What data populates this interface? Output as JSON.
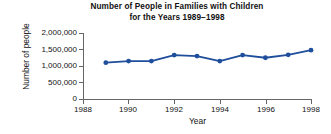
{
  "chart_data": {
    "type": "line",
    "title": "Number of People in Families with Children for the Years 1989−1998",
    "title_lines": [
      "Number of People in Families with Children",
      "for the Years 1989−1998"
    ],
    "xlabel": "Year",
    "ylabel": "Number of people",
    "x": [
      1989,
      1990,
      1991,
      1992,
      1993,
      1994,
      1995,
      1996,
      1997,
      1998
    ],
    "values": [
      1100000,
      1150000,
      1150000,
      1330000,
      1300000,
      1150000,
      1330000,
      1250000,
      1340000,
      1480000
    ],
    "series": [
      {
        "name": "Number of people",
        "values": [
          1100000,
          1150000,
          1150000,
          1330000,
          1300000,
          1150000,
          1330000,
          1250000,
          1340000,
          1480000
        ]
      }
    ],
    "xlim": [
      1988,
      1998
    ],
    "ylim": [
      0,
      2000000
    ],
    "xticks": [
      1988,
      1990,
      1992,
      1994,
      1996,
      1998
    ],
    "xtick_labels": [
      "1988",
      "1990",
      "1992",
      "1994",
      "1996",
      "1998"
    ],
    "yticks": [
      0,
      500000,
      1000000,
      1500000,
      2000000
    ],
    "ytick_labels": [
      "0",
      "500,000",
      "1,000,000",
      "1,500,000",
      "2,000,000"
    ],
    "grid": false,
    "legend": null,
    "marker": "circle",
    "line_color": "#1F4E9C",
    "marker_color": "#1F4E9C",
    "axis_color": "#666666",
    "background_color": "#FFFFFF"
  }
}
